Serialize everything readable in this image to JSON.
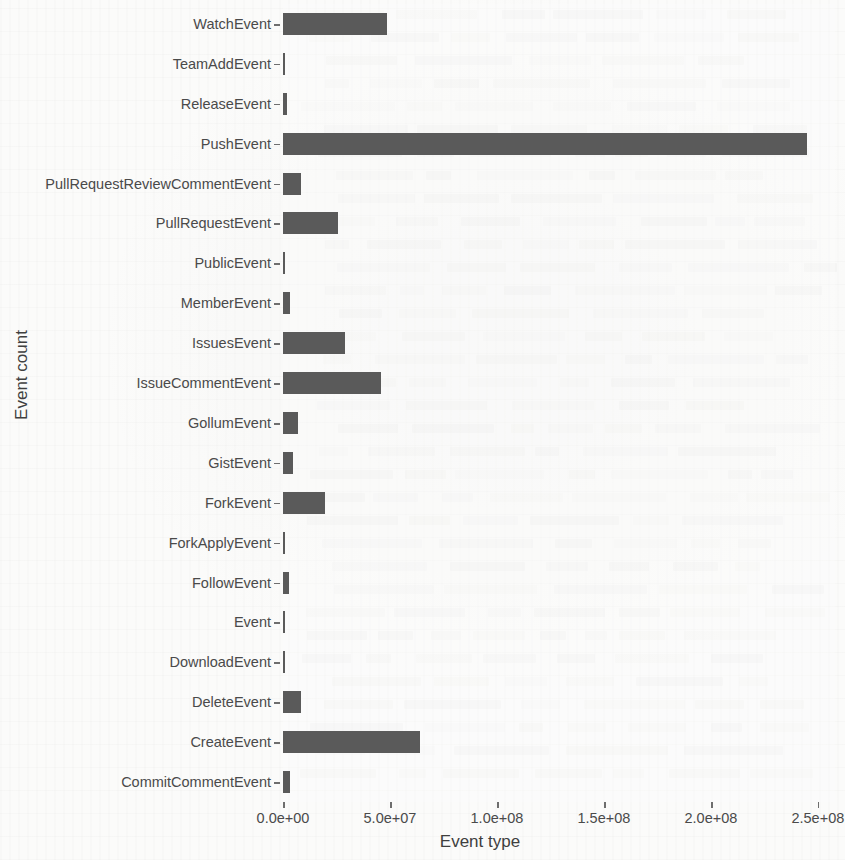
{
  "chart_data": {
    "type": "bar",
    "orientation": "horizontal",
    "title": "",
    "xlabel": "Event type",
    "ylabel": "Event count",
    "xlim": [
      0,
      258000000
    ],
    "grid": false,
    "legend": null,
    "bar_color": "#5a5a5a",
    "background_color": "#fbfbfa",
    "xticks": [
      0,
      50000000,
      100000000,
      150000000,
      200000000,
      250000000
    ],
    "xtick_labels": [
      "0.0e+00",
      "5.0e+07",
      "1.0e+08",
      "1.5e+08",
      "2.0e+08",
      "2.5e+08"
    ],
    "categories": [
      "WatchEvent",
      "TeamAddEvent",
      "ReleaseEvent",
      "PushEvent",
      "PullRequestReviewCommentEvent",
      "PullRequestEvent",
      "PublicEvent",
      "MemberEvent",
      "IssuesEvent",
      "IssueCommentEvent",
      "GollumEvent",
      "GistEvent",
      "ForkEvent",
      "ForkApplyEvent",
      "FollowEvent",
      "Event",
      "DownloadEvent",
      "DeleteEvent",
      "CreateEvent",
      "CommitCommentEvent"
    ],
    "values": [
      48500000,
      200000,
      1800000,
      245000000,
      8500000,
      25500000,
      700000,
      3500000,
      29000000,
      46000000,
      7000000,
      4500000,
      19500000,
      150000,
      3000000,
      500000,
      400000,
      8500000,
      64000000,
      3500000
    ]
  }
}
